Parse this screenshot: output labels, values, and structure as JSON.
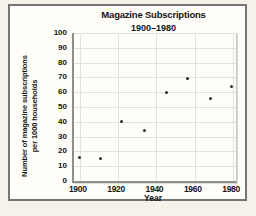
{
  "panel": {
    "background": "#fffdf8",
    "page_background": "#f5f2ea",
    "border_color": "#757575"
  },
  "chart_data": {
    "type": "scatter",
    "title": "Magazine Subscriptions",
    "subtitle": "1900–1980",
    "xlabel": "Year",
    "ylabel_line1": "Number of magazine subscriptions",
    "ylabel_line2": "per 1000 households",
    "xlim": [
      1897,
      1981.5
    ],
    "ylim": [
      0,
      100
    ],
    "x_ticks": [
      1900,
      1920,
      1940,
      1960,
      1980
    ],
    "y_ticks": [
      0,
      10,
      20,
      30,
      40,
      50,
      60,
      70,
      80,
      90,
      100
    ],
    "grid": true,
    "legend": "none",
    "points": [
      {
        "year": 1900,
        "value": 16
      },
      {
        "year": 1911,
        "value": 15
      },
      {
        "year": 1922,
        "value": 40
      },
      {
        "year": 1934,
        "value": 34
      },
      {
        "year": 1945,
        "value": 60
      },
      {
        "year": 1956,
        "value": 69
      },
      {
        "year": 1968,
        "value": 56
      },
      {
        "year": 1979,
        "value": 64
      }
    ],
    "style": {
      "point_color": "#2e2e2e",
      "grid_color": "#e1e1e1",
      "axis_color": "#8e8e8e",
      "text_color": "#141414"
    }
  }
}
